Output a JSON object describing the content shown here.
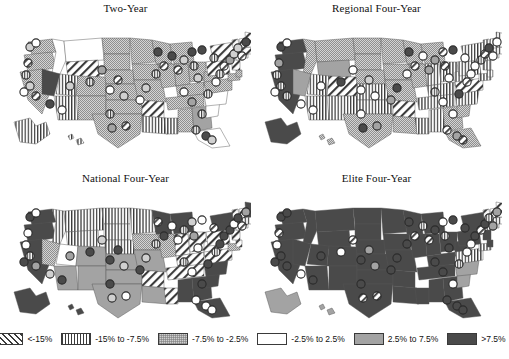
{
  "figure": {
    "type": "choropleth-map-grid",
    "rows": 2,
    "columns": 2
  },
  "panels": [
    {
      "id": "two-year",
      "title": "Two-Year"
    },
    {
      "id": "regional-four-year",
      "title": "Regional Four-Year"
    },
    {
      "id": "national-four-year",
      "title": "National Four-Year"
    },
    {
      "id": "elite-four-year",
      "title": "Elite Four-Year"
    }
  ],
  "legend": {
    "position": "bottom",
    "items": [
      {
        "label": "<-15%",
        "pattern": "diagonal-hatch",
        "color": "#ffffff"
      },
      {
        "label": "-15% to -7.5%",
        "pattern": "vertical-stripe",
        "color": "#ffffff"
      },
      {
        "label": "-7.5% to -2.5%",
        "pattern": "light-stipple",
        "color": "#cfcfcf"
      },
      {
        "label": "-2.5% to 2.5%",
        "pattern": "solid",
        "color": "#ffffff"
      },
      {
        "label": "2.5% to 7.5%",
        "pattern": "solid",
        "color": "#a3a3a3"
      },
      {
        "label": ">7.5%",
        "pattern": "solid",
        "color": "#4a4a4a"
      }
    ]
  },
  "chart_data": {
    "type": "heatmap",
    "title": "",
    "subtitle": "",
    "xlabel": "",
    "ylabel": "",
    "grid": false,
    "legend_position": "bottom",
    "value_unit": "percent change",
    "categories": [
      "<-15%",
      "-15% to -7.5%",
      "-7.5% to -2.5%",
      "-2.5% to 2.5%",
      "2.5% to 7.5%",
      ">7.5%"
    ],
    "category_fills": [
      "diagonal-hatch",
      "vertical-stripe",
      "light-stipple",
      "white",
      "mid-gray",
      "dark-gray"
    ],
    "panels": [
      {
        "name": "Two-Year",
        "states": {
          "WA": "-7.5% to -2.5%",
          "OR": "-7.5% to -2.5%",
          "CA": "-7.5% to -2.5%",
          "ID": "-2.5% to 2.5%",
          "NV": ">7.5%",
          "MT": "-2.5% to 2.5%",
          "WY": "<-15%",
          "UT": "-15% to -7.5%",
          "AZ": "-15% to -7.5%",
          "CO": "-7.5% to -2.5%",
          "NM": "-7.5% to -2.5%",
          "ND": "-7.5% to -2.5%",
          "SD": "-7.5% to -2.5%",
          "NE": "-7.5% to -2.5%",
          "KS": "-7.5% to -2.5%",
          "OK": "-7.5% to -2.5%",
          "TX": "-7.5% to -2.5%",
          "MN": "-7.5% to -2.5%",
          "IA": "-7.5% to -2.5%",
          "MO": "-7.5% to -2.5%",
          "AR": "<-15%",
          "LA": "-15% to -7.5%",
          "WI": "-7.5% to -2.5%",
          "IL": "-7.5% to -2.5%",
          "MS": "-15% to -7.5%",
          "MI": "-7.5% to -2.5%",
          "IN": "-7.5% to -2.5%",
          "KY": "-7.5% to -2.5%",
          "TN": "-7.5% to -2.5%",
          "AL": "-7.5% to -2.5%",
          "OH": "-7.5% to -2.5%",
          "WV": "-7.5% to -2.5%",
          "GA": "2.5% to 7.5%",
          "FL": "-2.5% to 2.5%",
          "SC": "-2.5% to 2.5%",
          "NC": "-2.5% to 2.5%",
          "VA": "-7.5% to -2.5%",
          "PA": "<-15%",
          "NY": "<-15%",
          "MD": "-7.5% to -2.5%",
          "DE": "-7.5% to -2.5%",
          "NJ": "<-15%",
          "CT": "<-15%",
          "RI": "<-15%",
          "MA": "<-15%",
          "VT": "<-15%",
          "NH": "<-15%",
          "ME": "<-15%",
          "AK": "-15% to -7.5%",
          "HI": "-15% to -7.5%"
        }
      },
      {
        "name": "Regional Four-Year",
        "states": {
          "WA": ">7.5%",
          "OR": ">7.5%",
          "CA": ">7.5%",
          "ID": "-7.5% to -2.5%",
          "NV": "2.5% to 7.5%",
          "MT": "-7.5% to -2.5%",
          "WY": "2.5% to 7.5%",
          "UT": "-15% to -7.5%",
          "AZ": "-15% to -7.5%",
          "CO": "<-15%",
          "NM": "-15% to -7.5%",
          "ND": "-7.5% to -2.5%",
          "SD": "-7.5% to -2.5%",
          "NE": "-7.5% to -2.5%",
          "KS": "-15% to -7.5%",
          "OK": "-15% to -7.5%",
          "TX": "-7.5% to -2.5%",
          "MN": "-7.5% to -2.5%",
          "IA": "-7.5% to -2.5%",
          "MO": "-7.5% to -2.5%",
          "AR": "<-15%",
          "LA": "-7.5% to -2.5%",
          "WI": "-7.5% to -2.5%",
          "IL": "-7.5% to -2.5%",
          "MS": "-15% to -7.5%",
          "MI": "-7.5% to -2.5%",
          "IN": "-15% to -7.5%",
          "KY": "-15% to -7.5%",
          "TN": "-15% to -7.5%",
          "AL": "-15% to -7.5%",
          "OH": "-15% to -7.5%",
          "WV": "-15% to -7.5%",
          "GA": "-7.5% to -2.5%",
          "FL": "-7.5% to -2.5%",
          "SC": "-7.5% to -2.5%",
          "NC": "-15% to -7.5%",
          "VA": "<-15%",
          "PA": "-15% to -7.5%",
          "NY": "-15% to -7.5%",
          "MD": "-15% to -7.5%",
          "DE": "-15% to -7.5%",
          "NJ": "-15% to -7.5%",
          "CT": "-15% to -7.5%",
          "RI": "-15% to -7.5%",
          "MA": "-15% to -7.5%",
          "VT": "-15% to -7.5%",
          "NH": "-15% to -7.5%",
          "ME": "-15% to -7.5%",
          "AK": ">7.5%",
          "HI": "-7.5% to -2.5%"
        }
      },
      {
        "name": "National Four-Year",
        "states": {
          "WA": ">7.5%",
          "OR": ">7.5%",
          "CA": ">7.5%",
          "ID": "-15% to -7.5%",
          "NV": "-7.5% to -2.5%",
          "MT": "-15% to -7.5%",
          "WY": "-15% to -7.5%",
          "UT": "-2.5% to 2.5%",
          "AZ": "2.5% to 7.5%",
          "CO": "2.5% to 7.5%",
          "NM": "2.5% to 7.5%",
          "ND": "-15% to -7.5%",
          "SD": "-15% to -7.5%",
          "NE": "-15% to -7.5%",
          "KS": "2.5% to 7.5%",
          "OK": "2.5% to 7.5%",
          "TX": "2.5% to 7.5%",
          "MN": "-15% to -7.5%",
          "IA": "-7.5% to -2.5%",
          "MO": "2.5% to 7.5%",
          "AR": "<-15%",
          "LA": "2.5% to 7.5%",
          "WI": ">7.5%",
          "IL": "-7.5% to -2.5%",
          "MS": "<-15%",
          "MI": ">7.5%",
          "IN": "<-15%",
          "KY": "<-15%",
          "TN": "<-15%",
          "AL": ">7.5%",
          "OH": "<-15%",
          "WV": "<-15%",
          "GA": ">7.5%",
          "FL": ">7.5%",
          "SC": ">7.5%",
          "NC": ">7.5%",
          "VA": "<-15%",
          "PA": "<-15%",
          "NY": ">7.5%",
          "MD": "-7.5% to -2.5%",
          "DE": "<-15%",
          "NJ": "<-15%",
          "CT": "<-15%",
          "RI": "<-15%",
          "MA": "-15% to -7.5%",
          "VT": "<-15%",
          "NH": "<-15%",
          "ME": ">7.5%",
          "AK": ">7.5%",
          "HI": ">7.5%"
        }
      },
      {
        "name": "Elite Four-Year",
        "states": {
          "WA": ">7.5%",
          "OR": ">7.5%",
          "CA": ">7.5%",
          "ID": ">7.5%",
          "NV": ">7.5%",
          "MT": ">7.5%",
          "WY": ">7.5%",
          "UT": ">7.5%",
          "AZ": ">7.5%",
          "CO": ">7.5%",
          "NM": ">7.5%",
          "ND": ">7.5%",
          "SD": ">7.5%",
          "NE": ">7.5%",
          "KS": ">7.5%",
          "OK": ">7.5%",
          "TX": ">7.5%",
          "MN": ">7.5%",
          "IA": ">7.5%",
          "MO": ">7.5%",
          "AR": ">7.5%",
          "LA": ">7.5%",
          "WI": ">7.5%",
          "IL": ">7.5%",
          "MS": ">7.5%",
          "MI": ">7.5%",
          "IN": ">7.5%",
          "KY": ">7.5%",
          "TN": ">7.5%",
          "AL": ">7.5%",
          "OH": ">7.5%",
          "WV": ">7.5%",
          "GA": ">7.5%",
          "FL": ">7.5%",
          "SC": "2.5% to 7.5%",
          "NC": "2.5% to 7.5%",
          "VA": "-15% to -7.5%",
          "PA": ">7.5%",
          "NY": ">7.5%",
          "MD": "-15% to -7.5%",
          "DE": ">7.5%",
          "NJ": ">7.5%",
          "CT": "-15% to -7.5%",
          "RI": "-15% to -7.5%",
          "MA": "-15% to -7.5%",
          "VT": "<-15%",
          "NH": "<-15%",
          "ME": "<-15%",
          "AK": "2.5% to 7.5%",
          "HI": "2.5% to 7.5%"
        }
      }
    ]
  }
}
